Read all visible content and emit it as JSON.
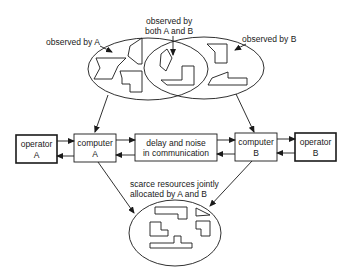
{
  "labels": {
    "observed_a": "observed by A",
    "observed_both_1": "observed by",
    "observed_both_2": "both A and B",
    "observed_b": "observed by B",
    "operator_a_1": "operator",
    "operator_a_2": "A",
    "computer_a_1": "computer",
    "computer_a_2": "A",
    "delay_1": "delay and noise",
    "delay_2": "in communication",
    "computer_b_1": "computer",
    "computer_b_2": "B",
    "operator_b_1": "operator",
    "operator_b_2": "B",
    "scarce_1": "scarce resources jointly",
    "scarce_2": "allocated by A and B"
  },
  "colors": {
    "stroke": "#1a1a1a",
    "background": "#ffffff"
  }
}
